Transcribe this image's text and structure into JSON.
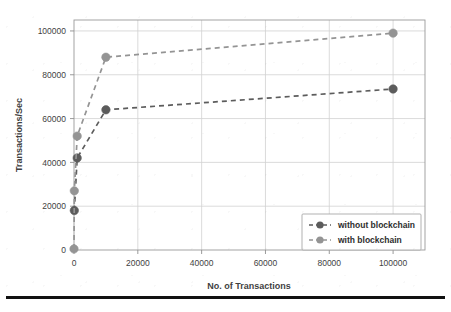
{
  "chart_data": {
    "type": "line",
    "title": "",
    "xlabel": "No. of Transactions",
    "ylabel": "Transactions/Sec",
    "xlim": [
      0,
      110000
    ],
    "ylim": [
      0,
      105000
    ],
    "grid": true,
    "legend_position": "lower right",
    "xticks": [
      0,
      20000,
      40000,
      60000,
      80000,
      100000
    ],
    "xtick_labels": [
      "0",
      "20000",
      "40000",
      "60000",
      "80000",
      "100000"
    ],
    "yticks": [
      0,
      20000,
      40000,
      60000,
      80000,
      100000
    ],
    "ytick_labels": [
      "0",
      "20000",
      "40000",
      "60000",
      "80000",
      "100000"
    ],
    "series": [
      {
        "name": "without blockchain",
        "color": "#5c5c5c",
        "marker": "circle",
        "linestyle": "dashed",
        "x": [
          100,
          1000,
          10000,
          100000
        ],
        "values": [
          18000,
          42000,
          64000,
          73500
        ]
      },
      {
        "name": "with blockchain",
        "color": "#949494",
        "marker": "circle",
        "linestyle": "dashed",
        "x": [
          0,
          100,
          1000,
          10000,
          100000
        ],
        "values": [
          500,
          27000,
          52000,
          88000,
          99000
        ]
      }
    ]
  },
  "legend": {
    "items": [
      {
        "label": "without blockchain",
        "color": "#5c5c5c"
      },
      {
        "label": "with blockchain",
        "color": "#949494"
      }
    ]
  },
  "axes": {
    "x_title": "No. of Transactions",
    "y_title": "Transactions/Sec"
  },
  "colors": {
    "series_dark": "#5c5c5c",
    "series_light": "#949494",
    "grid": "#d2d2d2",
    "frame": "#9a9a9a",
    "rule": "#111111"
  }
}
